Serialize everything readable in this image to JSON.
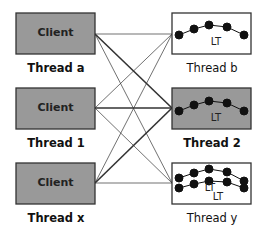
{
  "clients": [
    {
      "box_label": "Client",
      "thread_label": "Thread a"
    },
    {
      "box_label": "Client",
      "thread_label": "Thread 1"
    },
    {
      "box_label": "Client",
      "thread_label": "Thread x"
    }
  ],
  "servers": [
    {
      "inner_labels": [
        "LT"
      ],
      "thread_label": "Thread b",
      "highlighted": false
    },
    {
      "inner_labels": [
        "LT"
      ],
      "thread_label": "Thread 2",
      "highlighted": true
    },
    {
      "inner_labels": [
        "LT",
        "LT"
      ],
      "thread_label": "Thread y",
      "highlighted": false
    }
  ],
  "colors": {
    "box_fill": "#999999",
    "line": "#333333"
  }
}
